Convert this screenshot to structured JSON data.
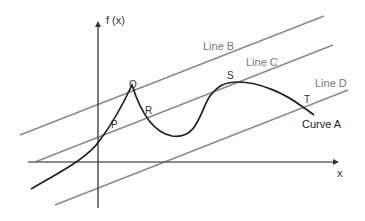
{
  "diagram": {
    "axes": {
      "y_label": "f (x)",
      "x_label": "x"
    },
    "lines": [
      {
        "id": "B",
        "label": "Line B",
        "color": "#8a8a8a"
      },
      {
        "id": "C",
        "label": "Line C",
        "color": "#8a8a8a"
      },
      {
        "id": "D",
        "label": "Line D",
        "color": "#8a8a8a"
      }
    ],
    "curve": {
      "label": "Curve A",
      "color": "#222222"
    },
    "points": [
      {
        "label": "P"
      },
      {
        "label": "Q"
      },
      {
        "label": "R"
      },
      {
        "label": "S"
      },
      {
        "label": "T"
      }
    ]
  }
}
